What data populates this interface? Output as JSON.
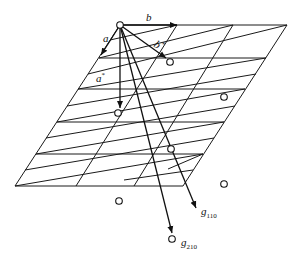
{
  "figure": {
    "type": "reciprocal-lattice-diagram",
    "labels": {
      "a": "a",
      "b": "b",
      "a_star": "a",
      "a_star_sup": "*",
      "b_star": "b",
      "b_star_sup": "*",
      "g110": "g",
      "g110_sub": "110",
      "g210": "g",
      "g210_sub": "210"
    },
    "origin": [
      120,
      25
    ],
    "lattice_points": [
      [
        120,
        25
      ],
      [
        170,
        62
      ],
      [
        120,
        113
      ],
      [
        224,
        97
      ],
      [
        172,
        148
      ],
      [
        224,
        184
      ],
      [
        120,
        202
      ],
      [
        172,
        239
      ]
    ],
    "colors": {
      "line": "#1a1a1a",
      "background": "#ffffff"
    }
  }
}
